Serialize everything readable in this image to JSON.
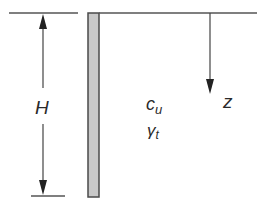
{
  "diagram": {
    "labels": {
      "height": "H",
      "cohesion_main": "c",
      "cohesion_sub": "u",
      "unit_weight_main": "γ",
      "unit_weight_sub": "t",
      "depth": "z"
    },
    "colors": {
      "line": "#555555",
      "wall_fill": "#c8c8c8",
      "wall_stroke": "#4a4a4a",
      "text": "#2a2a2a"
    }
  }
}
